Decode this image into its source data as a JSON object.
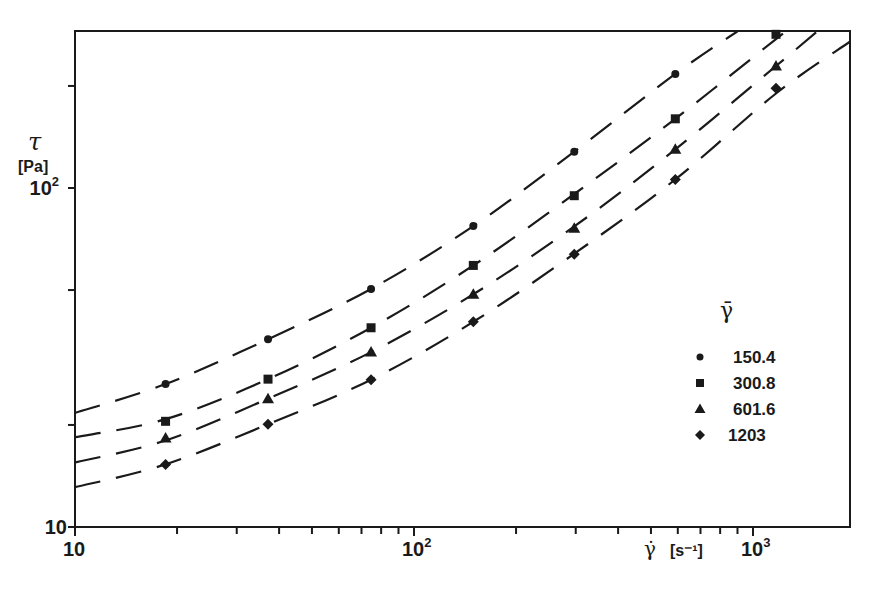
{
  "chart_data": {
    "type": "scatter",
    "scale": "log-log",
    "title": "",
    "xlabel": "γ̇ [s⁻¹]",
    "ylabel": "τ [Pa]",
    "ylabel_symbol": "τ",
    "ylabel_unit": "[Pa]",
    "xlabel_symbol": "γ̇",
    "xlabel_unit": "[s⁻¹]",
    "xlim": [
      10,
      1930
    ],
    "ylim": [
      10,
      290
    ],
    "grid": false,
    "x_tick_labels": [
      {
        "value": 10,
        "text": "10",
        "sup": ""
      },
      {
        "value": 100,
        "text": "10",
        "sup": "2"
      },
      {
        "value": 1000,
        "text": "10",
        "sup": "3"
      }
    ],
    "y_tick_labels": [
      {
        "value": 10,
        "text": "10",
        "sup": ""
      },
      {
        "value": 100,
        "text": "10",
        "sup": "2"
      }
    ],
    "legend": {
      "title": "γ̄",
      "position": "right-middle",
      "entries": [
        {
          "label": "150.4",
          "marker": "circle"
        },
        {
          "label": "300.8",
          "marker": "square"
        },
        {
          "label": "601.6",
          "marker": "triangle"
        },
        {
          "label": "1203",
          "marker": "diamond"
        }
      ]
    },
    "x": [
      18.5,
      37.1,
      74.7,
      149.6,
      297,
      590,
      1169
    ],
    "series": [
      {
        "name": "150.4",
        "marker": "circle",
        "values": [
          26.4,
          35.8,
          50.4,
          77.2,
          128,
          217,
          null
        ],
        "fit_curve": [
          [
            10,
            21.7
          ],
          [
            18.5,
            26.4
          ],
          [
            37.1,
            35.8
          ],
          [
            74.7,
            50.4
          ],
          [
            149.6,
            77.2
          ],
          [
            297,
            128
          ],
          [
            590,
            217
          ],
          [
            900,
            290
          ]
        ]
      },
      {
        "name": "300.8",
        "marker": "square",
        "values": [
          20.5,
          27.3,
          38.7,
          59.1,
          94.9,
          160,
          284
        ],
        "fit_curve": [
          [
            10,
            18.4
          ],
          [
            18.5,
            20.8
          ],
          [
            37.1,
            27.3
          ],
          [
            74.7,
            38.7
          ],
          [
            149.6,
            59.1
          ],
          [
            297,
            96
          ],
          [
            590,
            160
          ],
          [
            1169,
            275
          ],
          [
            1260,
            290
          ]
        ]
      },
      {
        "name": "601.6",
        "marker": "triangle",
        "values": [
          18.3,
          23.9,
          32.8,
          48.6,
          76.1,
          130,
          229
        ],
        "fit_curve": [
          [
            10,
            15.5
          ],
          [
            18.5,
            18.0
          ],
          [
            37.1,
            23.9
          ],
          [
            74.7,
            32.8
          ],
          [
            149.6,
            48.6
          ],
          [
            297,
            77
          ],
          [
            590,
            130
          ],
          [
            1169,
            229
          ],
          [
            1550,
            290
          ]
        ]
      },
      {
        "name": "1203",
        "marker": "diamond",
        "values": [
          15.3,
          20.1,
          27.2,
          40.3,
          63.8,
          106,
          197
        ],
        "fit_curve": [
          [
            10,
            13.1
          ],
          [
            18.5,
            15.3
          ],
          [
            37.1,
            20.1
          ],
          [
            74.7,
            27.2
          ],
          [
            149.6,
            40.3
          ],
          [
            297,
            64
          ],
          [
            590,
            106
          ],
          [
            1169,
            190
          ],
          [
            1930,
            270
          ]
        ]
      }
    ]
  }
}
